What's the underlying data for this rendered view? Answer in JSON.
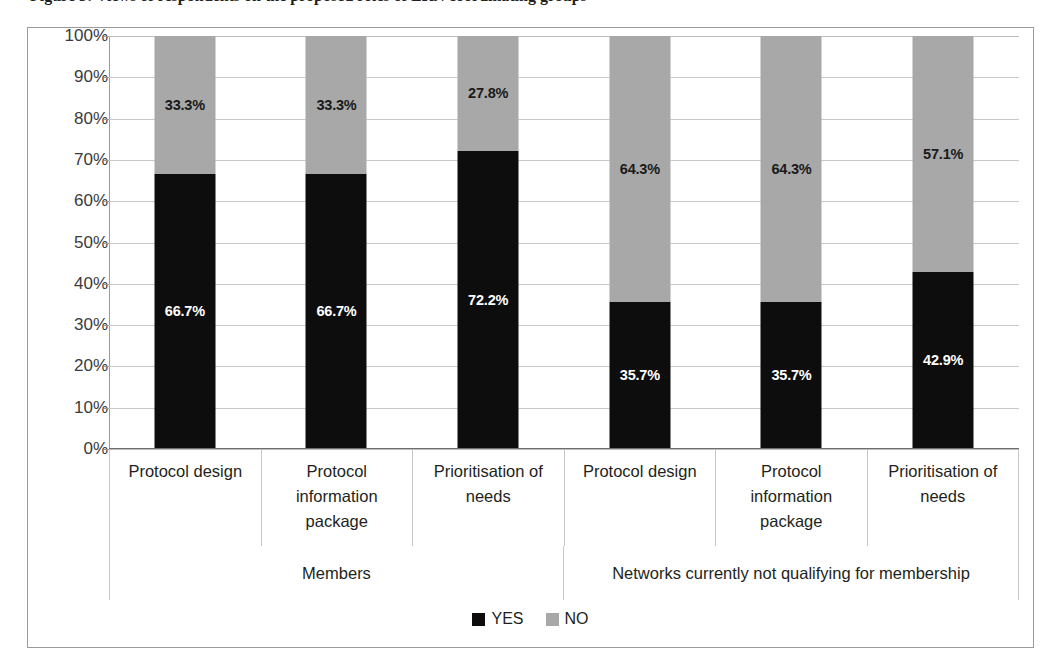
{
  "figure": {
    "caption": "Figure 3: Views of respondents on the proposed roles of ERN coordinating groups"
  },
  "chart_data": {
    "type": "bar",
    "subtype": "stacked-100-percent",
    "title": "",
    "xlabel": "",
    "ylabel": "",
    "ylim": [
      0,
      100
    ],
    "ytick_labels": [
      "0%",
      "10%",
      "20%",
      "30%",
      "40%",
      "50%",
      "60%",
      "70%",
      "80%",
      "90%",
      "100%"
    ],
    "ytick_values": [
      0,
      10,
      20,
      30,
      40,
      50,
      60,
      70,
      80,
      90,
      100
    ],
    "grid": true,
    "legend_position": "bottom",
    "categories": [
      "Protocol design",
      "Protocol information package",
      "Prioritisation of needs",
      "Protocol design",
      "Protocol information package",
      "Prioritisation of needs"
    ],
    "groups": [
      {
        "label": "Members",
        "span": 3
      },
      {
        "label": "Networks currently not qualifying for membership",
        "span": 3
      }
    ],
    "series": [
      {
        "name": "YES",
        "color": "#0d0d0d",
        "values": [
          66.7,
          66.7,
          72.2,
          35.7,
          35.7,
          42.9
        ],
        "labels": [
          "66.7%",
          "66.7%",
          "72.2%",
          "35.7%",
          "35.7%",
          "42.9%"
        ]
      },
      {
        "name": "NO",
        "color": "#a8a8a8",
        "values": [
          33.3,
          33.3,
          27.8,
          64.3,
          64.3,
          57.1
        ],
        "labels": [
          "33.3%",
          "33.3%",
          "27.8%",
          "64.3%",
          "64.3%",
          "57.1%"
        ]
      }
    ],
    "legend": [
      {
        "label": "YES",
        "color": "#0d0d0d"
      },
      {
        "label": "NO",
        "color": "#a8a8a8"
      }
    ]
  }
}
